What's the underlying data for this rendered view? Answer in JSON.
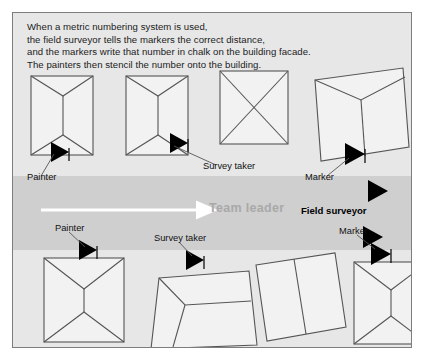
{
  "figure": {
    "background_color": "#e7e7e7",
    "band_color": "#cfcfcf",
    "shape_fill": "#f2f2f2",
    "shape_stroke": "#555555",
    "frame_stroke": "#7d7d7d",
    "marker_color": "#000000",
    "leader_arrow_color": "#ffffff",
    "leader_text_color": "#a9a9a9"
  },
  "intro": {
    "text": "When a metric numbering system is used,\nthe field surveyor tells the markers the correct distance,\nand the markers write that number in chalk on the building facade.\nThe painters then stencil the number onto the building."
  },
  "band": {
    "leader_label": "Team leader",
    "field_surveyor_label": "Field surveyor",
    "arrow_icon": "right-arrow-icon"
  },
  "labels": {
    "top_painter": "Painter",
    "top_survey_taker": "Survey taker",
    "top_marker": "Marker",
    "bottom_painter": "Painter",
    "bottom_survey_taker": "Survey taker",
    "bottom_marker": "Marker"
  },
  "top_row_shapes": [
    {
      "name": "building-top-1",
      "pattern": "y-left-chevron"
    },
    {
      "name": "building-top-2",
      "pattern": "y-left-chevron"
    },
    {
      "name": "building-top-3",
      "pattern": "x-cross"
    },
    {
      "name": "building-top-4",
      "pattern": "y-tilted"
    }
  ],
  "bottom_row_shapes": [
    {
      "name": "building-bottom-1",
      "pattern": "hourglass"
    },
    {
      "name": "building-bottom-2",
      "pattern": "trapezoid-inset"
    },
    {
      "name": "building-bottom-3",
      "pattern": "vertical-split-tilted"
    },
    {
      "name": "building-bottom-4",
      "pattern": "hourglass"
    }
  ],
  "markers": {
    "top": [
      "marker-triangle-top-1",
      "marker-triangle-top-3",
      "marker-triangle-top-4"
    ],
    "band": [
      "marker-triangle-band-1",
      "marker-triangle-band-2"
    ],
    "bottom": [
      "marker-triangle-bottom-1",
      "marker-triangle-bottom-2",
      "marker-triangle-bottom-4"
    ]
  }
}
